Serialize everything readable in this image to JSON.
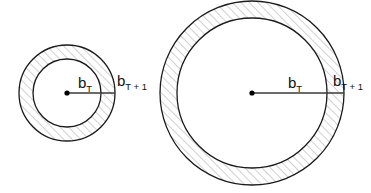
{
  "figure": {
    "type": "geometric-diagram",
    "background_color": "#ffffff",
    "stroke_color": "#1a1a1a",
    "hatch_color": "#9a9a9a",
    "radius_line_color": "#3a3a3a",
    "center_dot_color": "#000000",
    "panels": [
      {
        "id": "left-panel",
        "name": "small-annulus",
        "center": {
          "x": 67,
          "y": 93
        },
        "inner_radius": 34,
        "outer_radius": 48,
        "labels": {
          "inner": "b",
          "inner_sub": "T",
          "outer": "b",
          "outer_sub": "T + 1"
        },
        "inner_label_pos": {
          "x": 78,
          "y": 87
        },
        "outer_label_pos": {
          "x": 117,
          "y": 85
        },
        "radius_line": {
          "x1": 67,
          "y1": 93,
          "x2": 115,
          "y2": 93
        }
      },
      {
        "id": "right-panel",
        "name": "large-annulus",
        "center": {
          "x": 252,
          "y": 93
        },
        "inner_radius": 75,
        "outer_radius": 92,
        "labels": {
          "inner": "b",
          "inner_sub": "T",
          "outer": "b",
          "outer_sub": "T + 1"
        },
        "inner_label_pos": {
          "x": 288,
          "y": 87
        },
        "outer_label_pos": {
          "x": 333,
          "y": 85
        },
        "radius_line": {
          "x1": 252,
          "y1": 93,
          "x2": 344,
          "y2": 93
        }
      }
    ]
  },
  "labels": {
    "left_inner_base": "b",
    "left_inner_sub": "T",
    "left_outer_base": "b",
    "left_outer_sub": "T + 1",
    "right_inner_base": "b",
    "right_inner_sub": "T",
    "right_outer_base": "b",
    "right_outer_sub": "T + 1"
  }
}
